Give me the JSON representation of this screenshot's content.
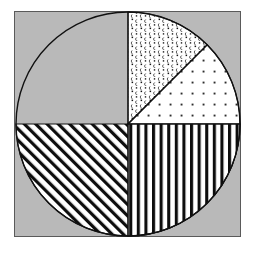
{
  "figure": {
    "title": "",
    "background_color": "#ffffff",
    "panel_color": "#b9b9b9",
    "panel_border_color": "#5a5a5a",
    "outline_color": "#111111"
  },
  "chart_data": {
    "type": "pie",
    "title": "",
    "xlabel": "",
    "ylabel": "",
    "categories": [
      "Slice A",
      "Slice B",
      "Slice C",
      "Slice D"
    ],
    "values": [
      50,
      12.5,
      12.5,
      25
    ],
    "labels_visible": false,
    "legend": {
      "visible": false,
      "position": "none",
      "entries": []
    },
    "grid": false,
    "start_angle_deg": 90,
    "direction": "clockwise",
    "center": {
      "x": 128,
      "y": 124
    },
    "radius": 112,
    "slices": [
      {
        "name": "Slice A",
        "value": 50,
        "percent": "50%",
        "start_angle_deg": 180,
        "end_angle_deg": 360,
        "hatch": "diagonal-forward-stripes",
        "hatch_label": "/ 45 degree stripes",
        "fill": "#ffffff",
        "ink": "#0d0d0d"
      },
      {
        "name": "Slice B",
        "value": 12.5,
        "percent": "12.5%",
        "start_angle_deg": 45,
        "end_angle_deg": 90,
        "hatch": "dense-scatter-glyphs",
        "hatch_label": "dense small glyph scatter",
        "fill": "#ffffff",
        "ink": "#1a1a1a"
      },
      {
        "name": "Slice C",
        "value": 12.5,
        "percent": "12.5%",
        "start_angle_deg": 0,
        "end_angle_deg": 45,
        "hatch": "sparse-dots",
        "hatch_label": "sparse dot grid",
        "fill": "#ffffff",
        "ink": "#3a3a3a"
      },
      {
        "name": "Slice D",
        "value": 25,
        "percent": "25%",
        "start_angle_deg": 270,
        "end_angle_deg": 360,
        "hatch": "vertical-stripes",
        "hatch_label": "vertical stripes",
        "fill": "#ffffff",
        "ink": "#0d0d0d"
      }
    ],
    "ylim": [
      0,
      100
    ],
    "xlim": [
      0,
      100
    ]
  }
}
